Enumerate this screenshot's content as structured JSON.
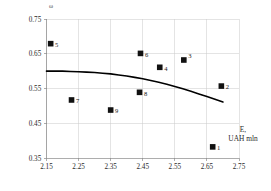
{
  "chart_data": {
    "type": "scatter",
    "title": "",
    "xlabel": "E, UAH mln",
    "xlabel_lines": [
      "E,",
      "UAH mln"
    ],
    "ylabel": "ω",
    "xlim": [
      2.15,
      2.75
    ],
    "ylim": [
      0.35,
      0.75
    ],
    "xticks": [
      "2.15",
      "2.25",
      "2.35",
      "2.45",
      "2.55",
      "2.65",
      "2.75"
    ],
    "yticks": [
      "0.35",
      "0.45",
      "0.55",
      "0.65",
      "0.75"
    ],
    "grid": true,
    "legend": "none",
    "points": [
      {
        "label": "1",
        "x": 2.668,
        "y": 0.382
      },
      {
        "label": "2",
        "x": 2.695,
        "y": 0.557
      },
      {
        "label": "3",
        "x": 2.578,
        "y": 0.632
      },
      {
        "label": "4",
        "x": 2.503,
        "y": 0.611
      },
      {
        "label": "5",
        "x": 2.163,
        "y": 0.679
      },
      {
        "label": "6",
        "x": 2.443,
        "y": 0.651
      },
      {
        "label": "7",
        "x": 2.228,
        "y": 0.517
      },
      {
        "label": "8",
        "x": 2.44,
        "y": 0.539
      },
      {
        "label": "9",
        "x": 2.35,
        "y": 0.488
      }
    ],
    "series": [
      {
        "name": "trend",
        "type": "line",
        "x": [
          2.15,
          2.2,
          2.25,
          2.3,
          2.35,
          2.4,
          2.45,
          2.5,
          2.55,
          2.6,
          2.65,
          2.7
        ],
        "y": [
          0.6,
          0.6,
          0.598,
          0.596,
          0.592,
          0.586,
          0.578,
          0.568,
          0.556,
          0.542,
          0.527,
          0.511
        ]
      }
    ],
    "colors": {
      "marker": "#111111",
      "curve": "#000000",
      "grid": "#c9c9c9",
      "axis": "#8a8a8a",
      "background": "#ffffff"
    }
  }
}
